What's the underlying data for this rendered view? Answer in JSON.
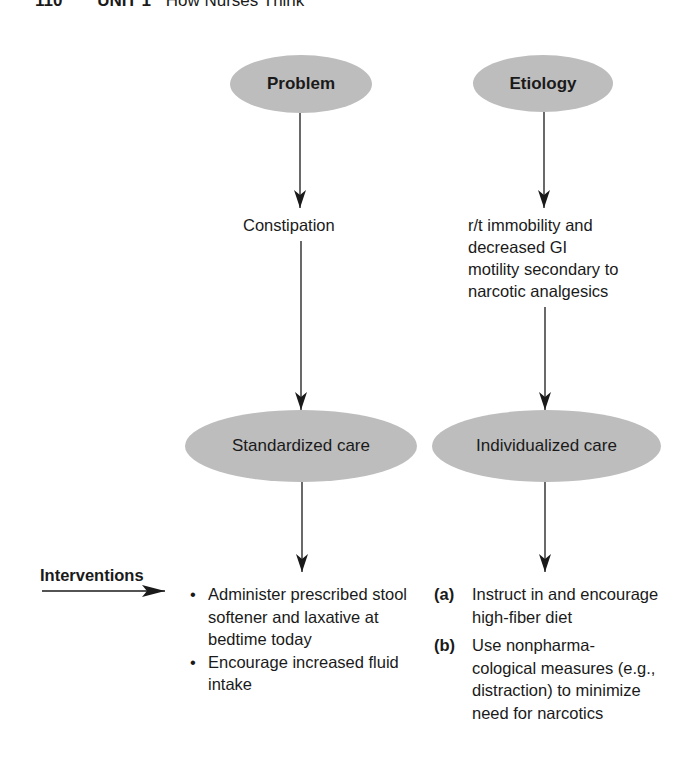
{
  "header": {
    "page_number": "110",
    "unit": "UNIT 1",
    "chapter": "How Nurses Think"
  },
  "diagram": {
    "problem_node": {
      "label": "Problem"
    },
    "etiology_node": {
      "label": "Etiology"
    },
    "problem_text": "Constipation",
    "etiology_text": [
      "r/t immobility and",
      "decreased GI",
      "motility secondary to",
      "narcotic analgesics"
    ],
    "standardized_node": {
      "label": "Standardized care"
    },
    "individualized_node": {
      "label": "Individualized care"
    },
    "interventions_label": "Interventions",
    "standardized_interventions": [
      {
        "bullet": "•",
        "text": "Administer prescribed stool softener and laxative at bedtime today"
      },
      {
        "bullet": "•",
        "text": "Encourage increased fluid intake"
      }
    ],
    "individualized_interventions": [
      {
        "marker": "(a)",
        "text": "Instruct in and encourage high-fiber diet"
      },
      {
        "marker": "(b)",
        "text": "Use nonpharma-cological measures (e.g., distraction) to minimize need for narcotics"
      }
    ],
    "colors": {
      "node_fill": "#bdbdbd",
      "text": "#1a1a1a",
      "arrow": "#1a1a1a"
    }
  }
}
